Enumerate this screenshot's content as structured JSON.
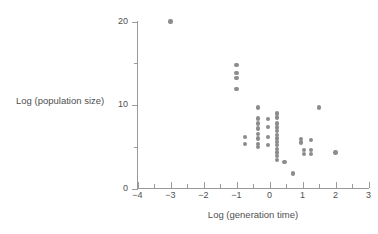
{
  "chart_data": {
    "type": "scatter",
    "title": "",
    "xlabel": "Log (generation time)",
    "ylabel": "Log (population size)",
    "xlim": [
      -4,
      3
    ],
    "ylim": [
      0,
      20
    ],
    "grid": false,
    "legend": null,
    "marker_color": "#8c8c8c",
    "axis_color": "#9a9a9a",
    "text_color": "#4f4f4f",
    "x_ticks_major": [
      -4,
      -3,
      -2,
      -1,
      0,
      1,
      2,
      3
    ],
    "x_tick_labels": [
      "−4",
      "−3",
      "−2",
      "−1",
      "0",
      "1",
      "2",
      "3"
    ],
    "x_ticks_minor": [
      -3.5,
      -2.5,
      -1.5,
      -0.5,
      0.5,
      1.5,
      2.5
    ],
    "y_ticks_major": [
      0,
      10,
      20
    ],
    "y_tick_labels": [
      "0",
      "10",
      "20"
    ],
    "y_ticks_minor": [
      5,
      15
    ],
    "points": [
      {
        "x": -3.0,
        "y": 20.0
      },
      {
        "x": -1.0,
        "y": 14.8
      },
      {
        "x": -1.0,
        "y": 13.8
      },
      {
        "x": -1.0,
        "y": 13.2
      },
      {
        "x": -1.0,
        "y": 11.9
      },
      {
        "x": -0.75,
        "y": 6.2
      },
      {
        "x": -0.75,
        "y": 5.3
      },
      {
        "x": -0.35,
        "y": 9.7
      },
      {
        "x": -0.35,
        "y": 8.4
      },
      {
        "x": -0.35,
        "y": 7.8
      },
      {
        "x": -0.35,
        "y": 7.2
      },
      {
        "x": -0.35,
        "y": 6.5
      },
      {
        "x": -0.35,
        "y": 6.0
      },
      {
        "x": -0.35,
        "y": 5.3
      },
      {
        "x": -0.35,
        "y": 5.0
      },
      {
        "x": -0.05,
        "y": 8.3
      },
      {
        "x": -0.05,
        "y": 7.4
      },
      {
        "x": -0.05,
        "y": 6.2
      },
      {
        "x": -0.05,
        "y": 5.2
      },
      {
        "x": 0.22,
        "y": 9.0
      },
      {
        "x": 0.22,
        "y": 8.5
      },
      {
        "x": 0.22,
        "y": 7.8
      },
      {
        "x": 0.22,
        "y": 7.3
      },
      {
        "x": 0.22,
        "y": 6.9
      },
      {
        "x": 0.22,
        "y": 6.4
      },
      {
        "x": 0.22,
        "y": 6.0
      },
      {
        "x": 0.22,
        "y": 5.6
      },
      {
        "x": 0.22,
        "y": 5.2
      },
      {
        "x": 0.22,
        "y": 4.7
      },
      {
        "x": 0.22,
        "y": 4.3
      },
      {
        "x": 0.22,
        "y": 3.9
      },
      {
        "x": 0.22,
        "y": 3.4
      },
      {
        "x": 0.45,
        "y": 3.2
      },
      {
        "x": 0.72,
        "y": 1.8
      },
      {
        "x": 0.95,
        "y": 5.9
      },
      {
        "x": 0.95,
        "y": 5.5
      },
      {
        "x": 1.05,
        "y": 4.6
      },
      {
        "x": 1.05,
        "y": 4.1
      },
      {
        "x": 1.25,
        "y": 5.8
      },
      {
        "x": 1.25,
        "y": 4.6
      },
      {
        "x": 1.25,
        "y": 4.1
      },
      {
        "x": 1.5,
        "y": 9.7
      },
      {
        "x": 2.0,
        "y": 4.3
      }
    ]
  }
}
